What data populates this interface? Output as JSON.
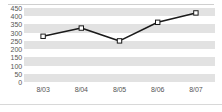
{
  "chart_data": {
    "type": "line",
    "title": "",
    "xlabel": "",
    "ylabel": "",
    "categories": [
      "8/03",
      "8/04",
      "8/05",
      "8/06",
      "8/07"
    ],
    "values": [
      278,
      328,
      250,
      363,
      420
    ],
    "series": [
      {
        "name": "",
        "values": [
          278,
          328,
          250,
          363,
          420
        ]
      }
    ],
    "ylim": [
      0,
      450
    ],
    "yticks": [
      0,
      50,
      100,
      150,
      200,
      250,
      300,
      350,
      400,
      450
    ],
    "ytick_labels": [
      "0",
      "50",
      "100",
      "150",
      "200",
      "250",
      "300",
      "350",
      "400",
      "450"
    ],
    "xtick_labels": [
      "8/03",
      "8/04",
      "8/05",
      "8/06",
      "8/07"
    ],
    "grid": true,
    "grid_style": "alternating-horizontal-bands",
    "legend": false,
    "legend_position": "none",
    "marker": "square-open",
    "colors": {
      "line": "#1a1a1a",
      "marker_fill": "#ffffff",
      "marker_stroke": "#1a1a1a",
      "band": "#e2e2e2",
      "plot_background": "#ffffff",
      "tick_label": "#555555",
      "rule": "#cfcfcf"
    }
  }
}
